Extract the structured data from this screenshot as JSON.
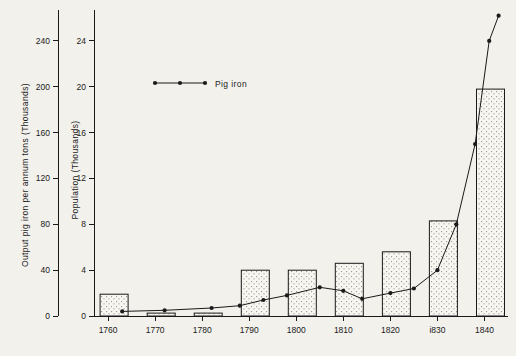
{
  "chart_data": {
    "type": "bar",
    "title": "",
    "subtitle": "",
    "xlabel": "",
    "ylabel_left": "Output pig iron per annum tons (Thousands)",
    "ylabel_right": "Population (Thousands)",
    "x": [
      1760,
      1770,
      1780,
      1790,
      1800,
      1810,
      1820,
      1830,
      1840
    ],
    "xtick_labels": [
      "1760",
      "1770",
      "1780",
      "1790",
      "1800",
      "1810",
      "1820",
      "i830",
      "1840"
    ],
    "left_axis": {
      "ticks": [
        0,
        40,
        80,
        120,
        160,
        200,
        240
      ],
      "tick_labels": [
        "0",
        "40",
        "80",
        "120",
        "160",
        "200",
        "240"
      ],
      "ylim": [
        0,
        260
      ]
    },
    "right_axis": {
      "ticks": [
        0,
        4,
        8,
        12,
        16,
        20,
        24
      ],
      "tick_labels": [
        "0",
        "4",
        "8",
        "12",
        "16",
        "20",
        "24"
      ],
      "ylim": [
        0,
        26
      ]
    },
    "bars": {
      "name": "Population",
      "unit": "Thousands",
      "categories": [
        "1760",
        "1770",
        "1780",
        "1790",
        "1800",
        "1810",
        "1820",
        "1830",
        "1840"
      ],
      "values": [
        1.9,
        0.25,
        0.25,
        4.0,
        4.0,
        4.6,
        5.6,
        8.3,
        19.8
      ]
    },
    "series": [
      {
        "name": "Pig iron",
        "unit": "Thousands of tons",
        "x": [
          1763,
          1772,
          1782,
          1788,
          1793,
          1798,
          1805,
          1810,
          1814,
          1820,
          1825,
          1830,
          1834,
          1838,
          1841,
          1843
        ],
        "values": [
          4,
          5,
          7,
          9,
          14,
          18,
          25,
          22,
          15,
          20,
          24,
          40,
          80,
          150,
          240,
          262
        ]
      }
    ],
    "legend": {
      "position": "top-left-inside",
      "entries": [
        "Pig iron"
      ]
    },
    "grid": false
  },
  "legend_label": "Pig iron"
}
